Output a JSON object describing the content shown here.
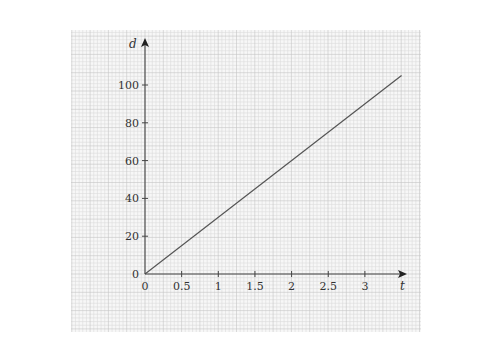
{
  "chart_data": {
    "type": "line",
    "title": "",
    "xlabel": "t",
    "ylabel": "d",
    "x_ticks": [
      "0",
      "0.5",
      "1",
      "1.5",
      "2",
      "2.5",
      "3"
    ],
    "y_ticks": [
      "0",
      "20",
      "40",
      "60",
      "80",
      "100"
    ],
    "xlim": [
      0,
      3.6
    ],
    "ylim": [
      0,
      110
    ],
    "grid": true,
    "grid_style": "graph paper (fine minor grid, major every 5 minor)",
    "series": [
      {
        "name": "d(t)",
        "x": [
          0,
          3.5
        ],
        "y": [
          0,
          105
        ],
        "color": "#555555"
      }
    ]
  },
  "axes": {
    "x_label": "t",
    "y_label": "d"
  },
  "colors": {
    "panel_bg": "#f7f7f7",
    "grid_minor": "#dcdcdc",
    "grid_major": "#c4c4c4",
    "axis": "#444444",
    "line": "#666666"
  }
}
